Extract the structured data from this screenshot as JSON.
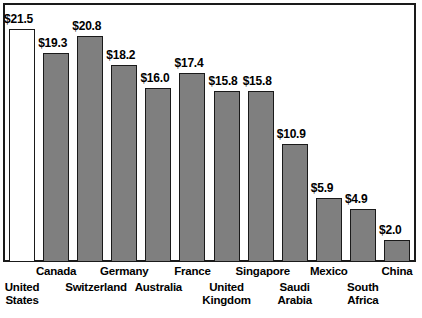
{
  "chart_data": {
    "type": "bar",
    "title": "",
    "subtitle": "",
    "xlabel": "",
    "ylabel": "",
    "grid": false,
    "legend": null,
    "ylim": [
      0,
      23.5
    ],
    "value_prefix": "$",
    "categories": [
      "United\nStates",
      "Canada",
      "Switzerland",
      "Germany",
      "Australia",
      "France",
      "United\nKingdom",
      "Singapore",
      "Saudi\nArabia",
      "Mexico",
      "South\nAfrica",
      "China"
    ],
    "values": [
      21.5,
      19.3,
      20.8,
      18.2,
      16.0,
      17.4,
      15.8,
      15.8,
      10.9,
      5.9,
      4.9,
      2.0
    ],
    "value_labels": [
      "$21.5",
      "$19.3",
      "$20.8",
      "$18.2",
      "$16.0",
      "$17.4",
      "$15.8",
      "$15.8",
      "$10.9",
      "$5.9",
      "$4.9",
      "$2.0"
    ],
    "label_rows": [
      "bottom",
      "top",
      "bottom",
      "top",
      "bottom",
      "top",
      "bottom",
      "top",
      "bottom",
      "top",
      "bottom",
      "top"
    ],
    "bar_fills": [
      "white",
      "gray",
      "gray",
      "gray",
      "gray",
      "gray",
      "gray",
      "gray",
      "gray",
      "gray",
      "gray",
      "gray"
    ]
  },
  "style": {
    "bar_gray": "#7f7f7f",
    "bar_white": "#ffffff",
    "outline": "#1a1a1a",
    "background": "#ffffff",
    "text": "#000000"
  }
}
